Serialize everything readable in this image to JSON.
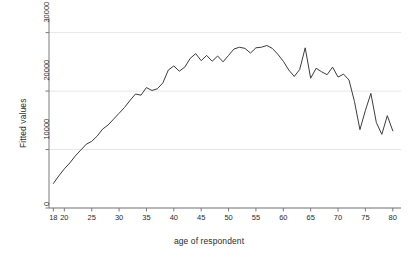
{
  "chart_data": {
    "type": "line",
    "title": "",
    "subtitle": "",
    "xlabel": "age of respondent",
    "ylabel": "Fitted values",
    "xlim": [
      17.2,
      81.5
    ],
    "ylim": [
      0,
      32500
    ],
    "grid": true,
    "grid_axis": "y",
    "legend": "none",
    "xticks": [
      18,
      20,
      25,
      30,
      35,
      40,
      45,
      50,
      55,
      60,
      65,
      70,
      75,
      80
    ],
    "xtick_labels": [
      "18",
      "20",
      "25",
      "30",
      "35",
      "40",
      "45",
      "50",
      "55",
      "60",
      "65",
      "70",
      "75",
      "80"
    ],
    "yticks": [
      0,
      10000,
      20000,
      30000
    ],
    "ytick_labels": [
      "0",
      "10000",
      "20000",
      "30000"
    ],
    "line_color": "#3c3c3c",
    "line_width": 1,
    "background_color": "#ffffff",
    "series": [
      {
        "name": "Fitted values",
        "x": [
          18,
          19,
          20,
          21,
          22,
          23,
          24,
          25,
          26,
          27,
          28,
          29,
          30,
          31,
          32,
          33,
          34,
          35,
          36,
          37,
          38,
          39,
          40,
          41,
          42,
          43,
          44,
          45,
          46,
          47,
          48,
          49,
          50,
          51,
          52,
          53,
          54,
          55,
          56,
          57,
          58,
          59,
          60,
          61,
          62,
          63,
          64,
          65,
          66,
          67,
          68,
          69,
          70,
          71,
          72,
          73,
          74,
          75,
          76,
          77,
          78,
          79,
          80
        ],
        "values": [
          4200,
          5500,
          6700,
          7700,
          8900,
          9900,
          10900,
          11400,
          12300,
          13500,
          14200,
          15200,
          16200,
          17200,
          18400,
          19500,
          19300,
          20600,
          20100,
          20400,
          21400,
          23600,
          24300,
          23400,
          24100,
          25600,
          26400,
          25200,
          26100,
          25100,
          26000,
          25000,
          26100,
          27200,
          27500,
          27300,
          26500,
          27400,
          27500,
          27800,
          27300,
          26300,
          25100,
          23600,
          22500,
          23700,
          27400,
          22200,
          23900,
          23300,
          22800,
          24100,
          22400,
          22900,
          21900,
          18200,
          13400,
          16700,
          19600,
          14600,
          12600,
          15800,
          13200
        ]
      }
    ]
  },
  "axes": {
    "x_title": "age of respondent",
    "y_title": "Fitted values"
  }
}
